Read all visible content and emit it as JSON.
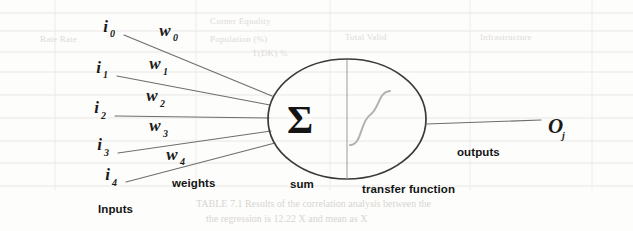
{
  "diagram": {
    "background": {
      "kind": "scanned-page",
      "page_color": "#fdfdfc",
      "rule_color": "#e9e7e4",
      "ghost_lines": [
        "Corner Equality",
        "Total Valid",
        "Population (%)",
        "Infrastructure",
        "Rate Rate",
        "T(DK) %",
        "TABLE 7.1 Results of the correlation analysis between the",
        "the regression is 12.22 X and mean as  X"
      ]
    },
    "inputs": {
      "group_label": "Inputs",
      "nodes": [
        {
          "base": "i",
          "sub": "0"
        },
        {
          "base": "i",
          "sub": "1"
        },
        {
          "base": "i",
          "sub": "2"
        },
        {
          "base": "i",
          "sub": "3"
        },
        {
          "base": "i",
          "sub": "4"
        }
      ]
    },
    "weights": {
      "group_label": "weights",
      "nodes": [
        {
          "base": "w",
          "sub": "0"
        },
        {
          "base": "w",
          "sub": "1"
        },
        {
          "base": "w",
          "sub": "2"
        },
        {
          "base": "w",
          "sub": "3"
        },
        {
          "base": "w",
          "sub": "4"
        }
      ]
    },
    "sum": {
      "group_label": "sum",
      "glyph": "Σ"
    },
    "transfer": {
      "group_label": "transfer function",
      "curve_shape": "sigmoid"
    },
    "outputs": {
      "group_label": "outputs",
      "node": {
        "base": "O",
        "sub": "j"
      }
    },
    "colors": {
      "ink": "#1b1b1b",
      "line": "#6e6e6e",
      "neuron_stroke": "#3a3a3a",
      "sigmoid_stroke": "#b4b2b0",
      "divider": "#9a9a9a"
    }
  }
}
